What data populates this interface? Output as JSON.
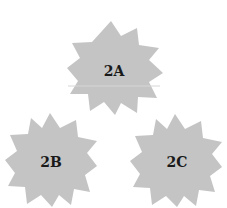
{
  "figure": {
    "background": "#ffffff",
    "fill_color": "#c4c4c4",
    "label_color": "#1a1a1a",
    "shapes": [
      {
        "id": "2A",
        "label": "2A",
        "shape": "12-point star",
        "center": [
          114,
          66
        ]
      },
      {
        "id": "2B",
        "label": "2B",
        "shape": "12-point star",
        "center": [
          51,
          160
        ]
      },
      {
        "id": "2C",
        "label": "2C",
        "shape": "12-point star",
        "center": [
          176,
          160
        ]
      }
    ]
  }
}
